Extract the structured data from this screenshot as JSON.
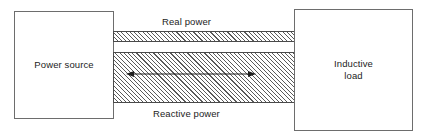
{
  "diagram": {
    "background_color": "#ffffff",
    "line_color": "#4a4a4a",
    "text_color": "#232323",
    "hatch_color": "#5a5a5a",
    "blocks": [
      {
        "id": "power-source",
        "label": "Power source",
        "side": "left"
      },
      {
        "id": "inductive-load",
        "label_line1": "Inductive",
        "label_line2": "load",
        "side": "right"
      }
    ],
    "bands": [
      {
        "id": "real-power",
        "label": "Real power",
        "fill": "diagonal-hatch",
        "thickness": "thin",
        "direction": "unidirectional"
      },
      {
        "id": "reactive-power",
        "label": "Reactive power",
        "fill": "diagonal-hatch",
        "thickness": "thick",
        "direction": "bidirectional"
      }
    ],
    "arrow": {
      "name": "reactive-power-double-arrow",
      "heads": "both",
      "orientation": "horizontal"
    }
  }
}
